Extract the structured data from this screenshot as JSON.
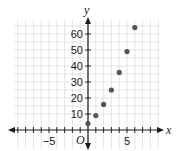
{
  "chart_data": {
    "type": "scatter",
    "title": "",
    "xlabel": "x",
    "ylabel": "y",
    "origin_label": "O",
    "xlim": [
      -9.5,
      8.5
    ],
    "ylim": [
      -4,
      70
    ],
    "x_grid_step": 1,
    "y_grid_step": 5,
    "x_tick_labels": [
      {
        "value": -5,
        "label": "−5"
      },
      {
        "value": 5,
        "label": "5"
      }
    ],
    "y_tick_labels": [
      {
        "value": 10,
        "label": "10"
      },
      {
        "value": 20,
        "label": "20"
      },
      {
        "value": 30,
        "label": "30"
      },
      {
        "value": 40,
        "label": "40"
      },
      {
        "value": 50,
        "label": "50"
      },
      {
        "value": 60,
        "label": "60"
      }
    ],
    "grid": true,
    "series": [
      {
        "name": "points",
        "color": "#555555",
        "points": [
          {
            "x": 0,
            "y": 4
          },
          {
            "x": 1,
            "y": 9
          },
          {
            "x": 2,
            "y": 16
          },
          {
            "x": 3,
            "y": 25
          },
          {
            "x": 4,
            "y": 36
          },
          {
            "x": 5,
            "y": 49
          },
          {
            "x": 6,
            "y": 64
          }
        ]
      }
    ]
  }
}
